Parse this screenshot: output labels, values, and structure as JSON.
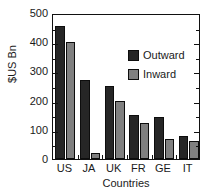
{
  "chart_data": {
    "type": "bar",
    "title": "",
    "subtitle": "",
    "xlabel": "Countries",
    "ylabel": "$US Bn",
    "categories": [
      "US",
      "JA",
      "UK",
      "FR",
      "GE",
      "IT"
    ],
    "series": [
      {
        "name": "Outward",
        "color": "#262626",
        "values": [
          455,
          270,
          250,
          150,
          143,
          78
        ]
      },
      {
        "name": "Inward",
        "color": "#808080",
        "values": [
          400,
          20,
          200,
          122,
          70,
          60
        ]
      }
    ],
    "ylim": [
      0,
      500
    ],
    "ytick_labels": [
      "0",
      "100",
      "200",
      "300",
      "400",
      "500"
    ],
    "ytick_values": [
      0,
      100,
      200,
      300,
      400,
      500
    ],
    "yminor_values": [
      50,
      150,
      250,
      350,
      450
    ],
    "grid": false,
    "legend_position": "upper right",
    "frame": true,
    "tick_direction": "in"
  },
  "axis": {
    "y_title": "$US Bn",
    "x_title": "Countries"
  }
}
